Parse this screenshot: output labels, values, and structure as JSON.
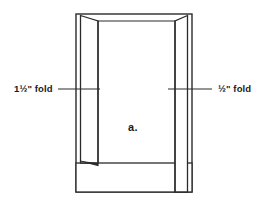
{
  "figure": {
    "caption": "a.",
    "left_label": "1½\" fold",
    "right_label": "½\" fold",
    "stroke_color": "#2b2b2b",
    "fill_color": "#ffffff",
    "background_color": "#ffffff"
  }
}
